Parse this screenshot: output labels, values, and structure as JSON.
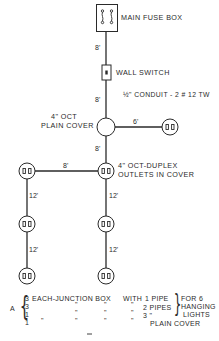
{
  "diagram": {
    "colors": {
      "line": "#2a2a2a",
      "background": "#ffffff"
    },
    "components": {
      "main_fuse_box": {
        "label": "MAIN FUSE BOX",
        "icon": "fuse-box-icon"
      },
      "wall_switch": {
        "label": "WALL SWITCH",
        "icon": "wall-switch-icon"
      },
      "conduit": {
        "label": "½\" CONDUIT - 2 # 12 TW"
      },
      "plain_cover": {
        "label_line1": "4\" OCT",
        "label_line2": "PLAIN COVER",
        "icon": "junction-box-plain-icon"
      },
      "duplex": {
        "label_line1": "4\" OCT-DUPLEX",
        "label_line2": "OUTLETS IN COVER",
        "icon": "duplex-outlet-icon"
      }
    },
    "dimensions": {
      "fuse_to_switch": "8'",
      "switch_to_plain": "8'",
      "plain_to_right_outlet": "6'",
      "plain_to_center_outlet": "8'",
      "center_to_left_outlet": "8'",
      "left_run_1": "12'",
      "left_run_2": "12'",
      "center_run_1": "12'",
      "center_run_2": "12'"
    },
    "materials_list": {
      "group_label": "A",
      "rows": [
        {
          "qty": "3",
          "item": "EACH-JUNCTION BOX",
          "c2": "WITH",
          "spec": "1 PIPE"
        },
        {
          "qty": "3",
          "item": "\"",
          "c1": "\"",
          "c2": "\"",
          "spec": "2 PIPES"
        },
        {
          "qty": "1",
          "item": "\"",
          "c1": "\"",
          "c2": "\"",
          "spec": "3   \""
        },
        {
          "qty": "1",
          "item": "\"",
          "c1": "\"",
          "c2": "\"",
          "spec": "PLAIN COVER"
        }
      ],
      "note_line1": "FOR 6",
      "note_line2": "HANGING",
      "note_line3": "LIGHTS"
    }
  }
}
